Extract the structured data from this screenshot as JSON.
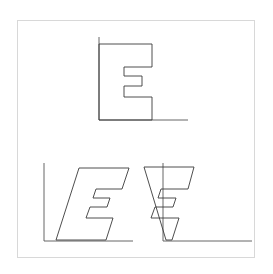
{
  "figure": {
    "title": "",
    "background_color": "#ffffff",
    "frame_color": "#d8d8d8",
    "stroke_color": "#3a3a3a",
    "axis_color": "#555555",
    "frame": {
      "x": 17,
      "y": 20,
      "width": 238,
      "height": 238
    }
  },
  "chart_data": {
    "type": "line",
    "title": "",
    "subtitle": "",
    "xlabel": "",
    "ylabel": "",
    "grid": false,
    "legend": null,
    "panels": [
      {
        "name": "original",
        "label": "",
        "shear": 0,
        "origin": {
          "x": 99,
          "y": 120
        },
        "axes": {
          "y_axis": {
            "x1": 99,
            "y1": 37,
            "x2": 99,
            "y2": 120
          },
          "x_axis": {
            "x1": 99,
            "y1": 120,
            "x2": 188,
            "y2": 120
          }
        },
        "polygon": [
          [
            99,
            44
          ],
          [
            152,
            44
          ],
          [
            152,
            67
          ],
          [
            124,
            67
          ],
          [
            124,
            76
          ],
          [
            142,
            76
          ],
          [
            142,
            86
          ],
          [
            124,
            86
          ],
          [
            124,
            97
          ],
          [
            152,
            97
          ],
          [
            152,
            120
          ],
          [
            99,
            120
          ],
          [
            99,
            44
          ]
        ]
      },
      {
        "name": "sheared-right",
        "label": "",
        "shear": 0.45,
        "origin": {
          "x": 44,
          "y": 241
        },
        "axes": {
          "y_axis": {
            "x1": 44,
            "y1": 163,
            "x2": 44,
            "y2": 241
          },
          "x_axis": {
            "x1": 44,
            "y1": 241,
            "x2": 133,
            "y2": 241
          }
        },
        "polygon": [
          [
            79,
            168
          ],
          [
            129,
            168
          ],
          [
            122,
            189
          ],
          [
            96,
            189
          ],
          [
            93,
            198
          ],
          [
            110,
            198
          ],
          [
            107,
            207
          ],
          [
            90,
            207
          ],
          [
            86,
            218
          ],
          [
            113,
            218
          ],
          [
            106,
            240
          ],
          [
            56,
            240
          ],
          [
            79,
            168
          ]
        ]
      },
      {
        "name": "sheared-left",
        "label": "",
        "shear": -0.45,
        "origin": {
          "x": 163,
          "y": 241
        },
        "axes": {
          "y_axis": {
            "x1": 163,
            "y1": 163,
            "x2": 163,
            "y2": 241
          },
          "x_axis": {
            "x1": 163,
            "y1": 241,
            "x2": 252,
            "y2": 241
          }
        },
        "polygon": [
          [
            144,
            167
          ],
          [
            194,
            167
          ],
          [
            188,
            189
          ],
          [
            161,
            189
          ],
          [
            158,
            198
          ],
          [
            176,
            198
          ],
          [
            173,
            207
          ],
          [
            155,
            207
          ],
          [
            151,
            218
          ],
          [
            179,
            218
          ],
          [
            172,
            240
          ],
          [
            166,
            240
          ],
          [
            144,
            167
          ]
        ]
      }
    ]
  }
}
